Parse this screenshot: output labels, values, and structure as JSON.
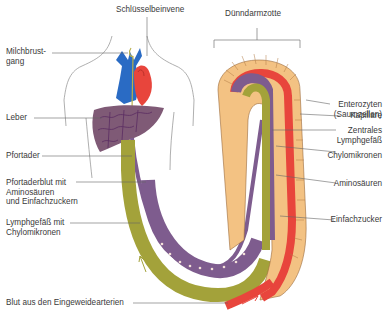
{
  "diagram": {
    "title_labels": {
      "subclavian_vein": "Schlüsselbeinvene",
      "villus": "Dünndarmzotte"
    },
    "left_labels": [
      {
        "id": "milchbrustgang",
        "text": "Milchbrust-\ngang"
      },
      {
        "id": "leber",
        "text": "Leber"
      },
      {
        "id": "pfortader",
        "text": "Pfortader"
      },
      {
        "id": "pfortaderblut",
        "text": "Pfortaderblut mit\nAminosäuren\nund Einfachzuckern"
      },
      {
        "id": "lymphgefaess",
        "text": "Lymphgefäß mit\nChylomikronen"
      },
      {
        "id": "blut",
        "text": "Blut aus den Eingeweidearterien"
      }
    ],
    "right_labels": [
      {
        "id": "enterozyten",
        "text": "Enterozyten\n(Saumzellen)"
      },
      {
        "id": "kapillare",
        "text": "Kapillare"
      },
      {
        "id": "zentrales_lymphgefaess",
        "text": "Zentrales\nLymphgefäß"
      },
      {
        "id": "chylomikronen",
        "text": "Chylomikronen"
      },
      {
        "id": "aminosaeuren",
        "text": "Aminosäuren"
      },
      {
        "id": "einfachzucker",
        "text": "Einfachzucker"
      }
    ],
    "colors": {
      "vein_blue": "#2a6bc4",
      "artery_red": "#e8453c",
      "liver": "#7f5a76",
      "portal_purple": "#7e5c8e",
      "lymph_olive": "#a3a23a",
      "enterocyte": "#f3c283",
      "label_line": "#666666"
    }
  }
}
